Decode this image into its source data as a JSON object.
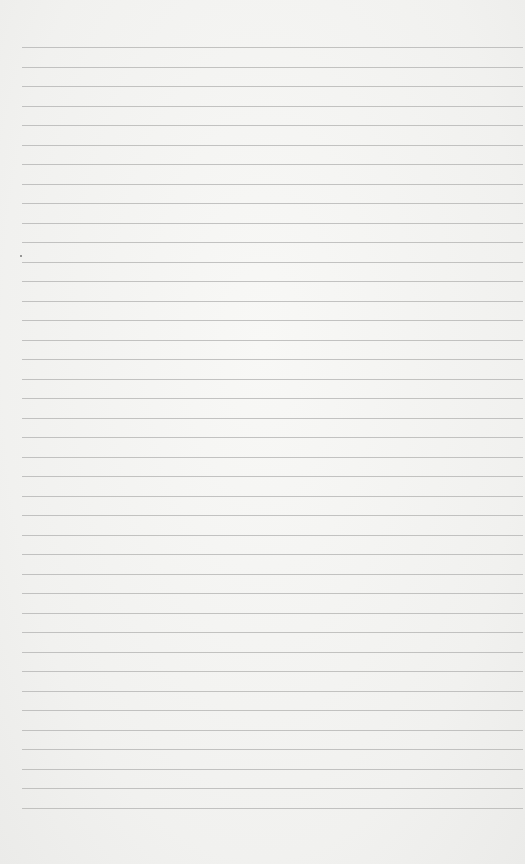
{
  "paper": {
    "type": "lined-notebook-paper",
    "line_count": 40,
    "first_line_y": 47,
    "line_spacing": 19.5,
    "line_left": 22,
    "line_color": "#b9b9b7",
    "background_color": "#f3f3f1",
    "mark": {
      "x": 20,
      "y": 255,
      "color": "#777777"
    }
  }
}
